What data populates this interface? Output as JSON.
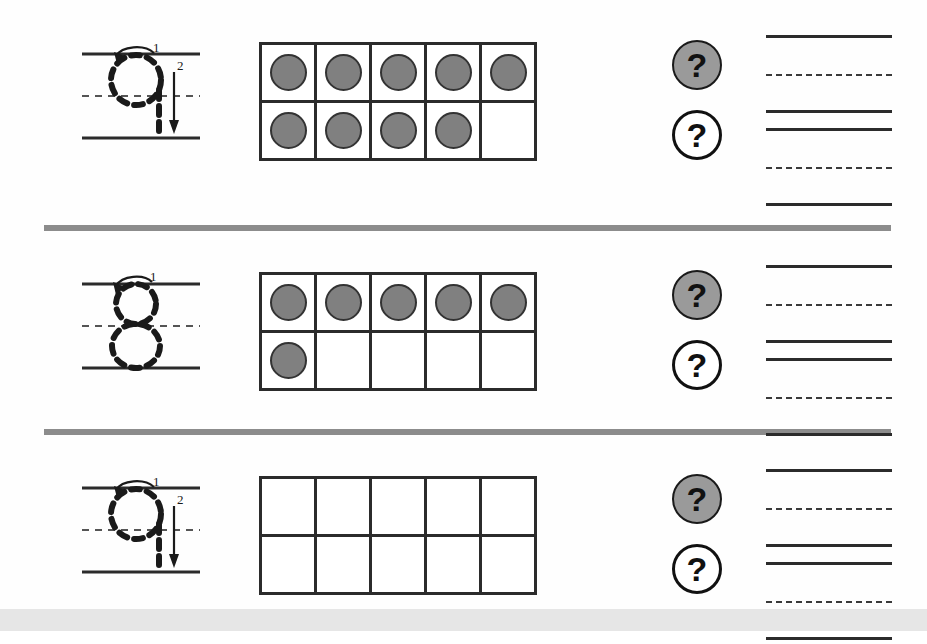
{
  "worksheet": {
    "title": "Number tracing and ten-frame counting worksheet",
    "background_color": "#fefefe",
    "separator_color": "#8c8c8c",
    "bottom_band_color": "#e6e6e6",
    "dot_fill_color": "#808080",
    "dot_outline_color": "#333333",
    "grid_line_color": "#2b2b2b",
    "badge_filled_color": "#9a9a9a",
    "badge_outline_color": "#111111"
  },
  "rows": [
    {
      "id": "row-1",
      "trace": {
        "digit": "9",
        "stroke_labels": [
          "1",
          "2"
        ],
        "stroke_count": 2,
        "guideline_style": "solid-dashed-solid"
      },
      "tenframe": {
        "columns": 5,
        "rows": 2,
        "filled_count": 9,
        "cells": [
          [
            true,
            true,
            true,
            true,
            true
          ],
          [
            true,
            true,
            true,
            true,
            false
          ]
        ]
      },
      "badges": [
        {
          "symbol": "?",
          "style": "filled"
        },
        {
          "symbol": "?",
          "style": "outline"
        }
      ],
      "writing_lines": [
        {
          "style": "solid"
        },
        {
          "style": "dashed"
        },
        {
          "style": "solid"
        },
        {
          "style": "solid"
        },
        {
          "style": "dashed"
        },
        {
          "style": "solid"
        }
      ]
    },
    {
      "id": "row-2",
      "trace": {
        "digit": "8",
        "stroke_labels": [
          "1"
        ],
        "stroke_count": 1,
        "guideline_style": "solid-dashed-solid"
      },
      "tenframe": {
        "columns": 5,
        "rows": 2,
        "filled_count": 6,
        "cells": [
          [
            true,
            true,
            true,
            true,
            true
          ],
          [
            true,
            false,
            false,
            false,
            false
          ]
        ]
      },
      "badges": [
        {
          "symbol": "?",
          "style": "filled"
        },
        {
          "symbol": "?",
          "style": "outline"
        }
      ],
      "writing_lines": [
        {
          "style": "solid"
        },
        {
          "style": "dashed"
        },
        {
          "style": "solid"
        },
        {
          "style": "solid"
        },
        {
          "style": "dashed"
        },
        {
          "style": "solid"
        }
      ]
    },
    {
      "id": "row-3",
      "trace": {
        "digit": "9",
        "stroke_labels": [
          "1",
          "2"
        ],
        "stroke_count": 2,
        "guideline_style": "solid-dashed-solid"
      },
      "tenframe": {
        "columns": 5,
        "rows": 2,
        "filled_count": 0,
        "cells": [
          [
            false,
            false,
            false,
            false,
            false
          ],
          [
            false,
            false,
            false,
            false,
            false
          ]
        ]
      },
      "badges": [
        {
          "symbol": "?",
          "style": "filled"
        },
        {
          "symbol": "?",
          "style": "outline"
        }
      ],
      "writing_lines": [
        {
          "style": "solid"
        },
        {
          "style": "dashed"
        },
        {
          "style": "solid"
        },
        {
          "style": "solid"
        },
        {
          "style": "dashed"
        },
        {
          "style": "solid"
        }
      ]
    }
  ]
}
